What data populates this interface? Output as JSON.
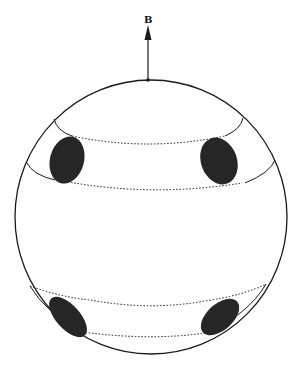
{
  "figure": {
    "field_label": "B",
    "colors": {
      "line": "#1a1a1a",
      "spot": "#262626",
      "background": "#ffffff"
    },
    "sphere": {
      "cx": 151,
      "cy": 217,
      "rx": 136,
      "ry": 137
    },
    "arrow": {
      "x": 148,
      "y_base": 80,
      "y_tip": 18
    },
    "bands": [
      {
        "name": "upper-band",
        "upper_ring_y": 120,
        "lower_ring_y": 168
      },
      {
        "name": "lower-band",
        "upper_ring_y": 288,
        "lower_ring_y": 333
      }
    ],
    "spots": [
      {
        "name": "spot-upper-left",
        "cx": 67,
        "cy": 160
      },
      {
        "name": "spot-upper-right",
        "cx": 219,
        "cy": 161
      },
      {
        "name": "spot-lower-left",
        "cx": 68,
        "cy": 317
      },
      {
        "name": "spot-lower-right",
        "cx": 220,
        "cy": 317
      }
    ]
  }
}
